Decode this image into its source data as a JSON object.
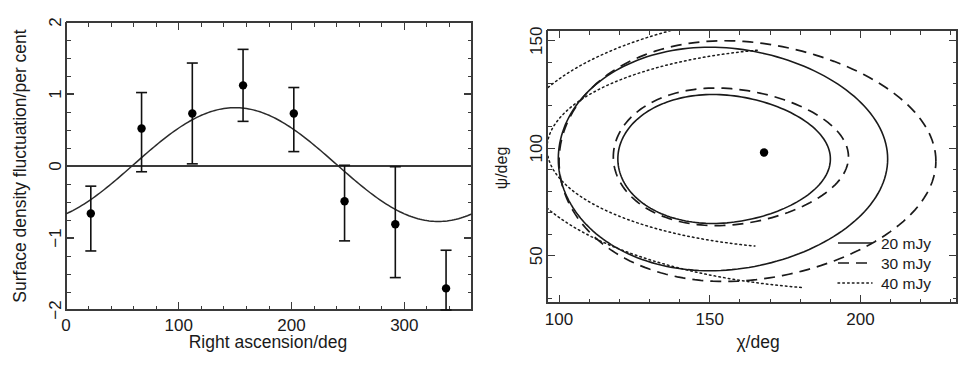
{
  "figure": {
    "width": 972,
    "height": 367,
    "background": "#ffffff",
    "ink_color": "#1a1a1a"
  },
  "chart_data": [
    {
      "id": "left-panel",
      "type": "scatter",
      "title": "",
      "xlabel": "Right ascension/deg",
      "ylabel": "Surface density fluctuation/per cent",
      "xlim": [
        0,
        360
      ],
      "ylim": [
        -2,
        2
      ],
      "xticks": [
        0,
        100,
        200,
        300
      ],
      "xticklabels": [
        "0",
        "100",
        "200",
        "300"
      ],
      "xtick_minor_step": 20,
      "yticks": [
        -2,
        -1,
        0,
        1,
        2
      ],
      "yticklabels": [
        "−2",
        "−1",
        "0",
        "1",
        "2"
      ],
      "ytick_minor_step": 0.25,
      "grid": false,
      "legend": "none",
      "zero_reference_line": 0,
      "marker": "filled-circle",
      "x": [
        22,
        67,
        112,
        157,
        202,
        247,
        292,
        337
      ],
      "y": [
        -0.66,
        0.52,
        0.73,
        1.12,
        0.73,
        -0.49,
        -0.81,
        -1.7
      ],
      "yerr_low": [
        0.52,
        0.6,
        0.7,
        0.5,
        0.53,
        0.55,
        0.74,
        0.5
      ],
      "yerr_high": [
        0.38,
        0.5,
        0.7,
        0.5,
        0.36,
        0.5,
        0.8,
        0.53
      ],
      "fit_curve": {
        "name": "sinusoidal fit",
        "style": "solid",
        "amplitude": 0.79,
        "phase_deg": 150,
        "offset": 0.02
      }
    },
    {
      "id": "right-panel",
      "type": "line",
      "title": "",
      "xlabel": "χ/deg",
      "ylabel": "ψ/deg",
      "xlim": [
        96,
        232
      ],
      "ylim": [
        28,
        155
      ],
      "xticks": [
        100,
        150,
        200
      ],
      "xticklabels": [
        "100",
        "150",
        "200"
      ],
      "xtick_minor_step": 10,
      "yticks": [
        50,
        100,
        150
      ],
      "yticklabels": [
        "50",
        "100",
        "150"
      ],
      "ytick_minor_step": 10,
      "grid": false,
      "legend_position": "bottom-right",
      "best_fit_point": {
        "x": 168,
        "y": 98,
        "marker": "filled-circle"
      },
      "series": [
        {
          "name": "20 mJy",
          "style": "solid",
          "contours": 2
        },
        {
          "name": "30 mJy",
          "style": "dashed",
          "contours": 2
        },
        {
          "name": "40 mJy",
          "style": "dotted",
          "contours": 2
        }
      ],
      "legend_entries": [
        {
          "label": "20 mJy",
          "style": "solid"
        },
        {
          "label": "30 mJy",
          "style": "dashed"
        },
        {
          "label": "40 mJy",
          "style": "dotted"
        }
      ]
    }
  ]
}
